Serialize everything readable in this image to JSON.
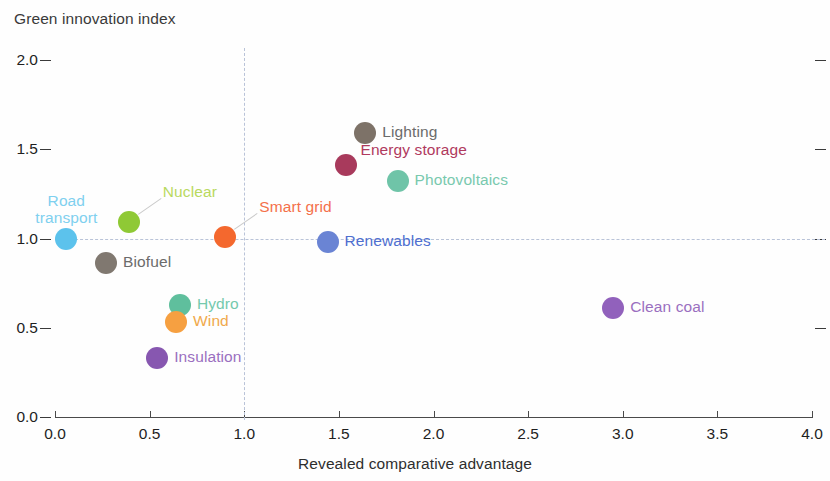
{
  "chart_data": {
    "type": "scatter",
    "title": "",
    "xlabel": "Revealed comparative advantage",
    "ylabel": "Green innovation index",
    "xlim": [
      0.0,
      4.0
    ],
    "ylim": [
      0.0,
      2.0
    ],
    "grid": false,
    "legend": "none",
    "xticks": [
      "0.0",
      "0.5",
      "1.0",
      "1.5",
      "2.0",
      "2.5",
      "3.0",
      "3.5",
      "4.0"
    ],
    "xtick_values": [
      0.0,
      0.5,
      1.0,
      1.5,
      2.0,
      2.5,
      3.0,
      3.5,
      4.0
    ],
    "yticks": [
      "2.0",
      "1.5",
      "1.0",
      "0.5",
      "0.0"
    ],
    "ytick_values": [
      2.0,
      1.5,
      1.0,
      0.5,
      0.0
    ],
    "reference_lines": [
      {
        "axis": "y",
        "value": 1.0,
        "style": "dashed",
        "color": "#b9c3d8"
      },
      {
        "axis": "x",
        "value": 1.0,
        "style": "dashed",
        "color": "#b9c3d8"
      }
    ],
    "points": [
      {
        "label": "Road transport",
        "x": 0.06,
        "y": 1.0,
        "color": "#5cc2ec",
        "label_color": "#7fd0ef",
        "label_pos": "above",
        "multiline": true,
        "leader": false
      },
      {
        "label": "Biofuel",
        "x": 0.27,
        "y": 0.86,
        "color": "#807870",
        "label_color": "#6b6b6b",
        "label_pos": "right",
        "multiline": false,
        "leader": false
      },
      {
        "label": "Nuclear",
        "x": 0.39,
        "y": 1.09,
        "color": "#8fc935",
        "label_color": "#b9d95e",
        "label_pos": "upper-right",
        "multiline": false,
        "leader": true
      },
      {
        "label": "Insulation",
        "x": 0.54,
        "y": 0.33,
        "color": "#8757b0",
        "label_color": "#9a6fc0",
        "label_pos": "right",
        "multiline": false,
        "leader": false
      },
      {
        "label": "Hydro",
        "x": 0.66,
        "y": 0.63,
        "color": "#5fbf9d",
        "label_color": "#74c9ad",
        "label_pos": "right",
        "multiline": false,
        "leader": false
      },
      {
        "label": "Wind",
        "x": 0.64,
        "y": 0.53,
        "color": "#f6a041",
        "label_color": "#f0a94b",
        "label_pos": "right",
        "multiline": false,
        "leader": false
      },
      {
        "label": "Smart grid",
        "x": 0.9,
        "y": 1.01,
        "color": "#f4682e",
        "label_color": "#f4704a",
        "label_pos": "upper-right",
        "multiline": false,
        "leader": true
      },
      {
        "label": "Renewables",
        "x": 1.44,
        "y": 0.98,
        "color": "#6a84d4",
        "label_color": "#4f6fd0",
        "label_pos": "right",
        "multiline": false,
        "leader": false
      },
      {
        "label": "Energy storage",
        "x": 1.54,
        "y": 1.41,
        "color": "#a83a5c",
        "label_color": "#b03a5e",
        "label_pos": "upper-right",
        "multiline": false,
        "leader": false
      },
      {
        "label": "Lighting",
        "x": 1.64,
        "y": 1.59,
        "color": "#7d7268",
        "label_color": "#6b6b6b",
        "label_pos": "right",
        "multiline": false,
        "leader": false
      },
      {
        "label": "Photovoltaics",
        "x": 1.81,
        "y": 1.32,
        "color": "#6fc4a8",
        "label_color": "#79c9ae",
        "label_pos": "right",
        "multiline": false,
        "leader": false
      },
      {
        "label": "Clean coal",
        "x": 2.95,
        "y": 0.61,
        "color": "#9161bc",
        "label_color": "#9a6fc0",
        "label_pos": "right",
        "multiline": false,
        "leader": false
      }
    ]
  },
  "axes": {
    "y_title": "Green innovation index",
    "x_title": "Revealed comparative advantage"
  }
}
